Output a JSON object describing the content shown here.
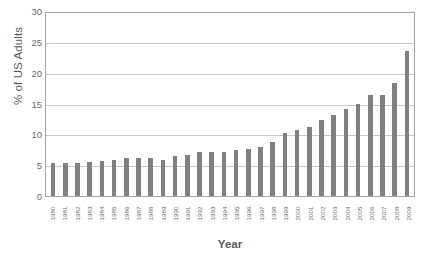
{
  "chart_data": {
    "type": "bar",
    "title": "",
    "xlabel": "Year",
    "ylabel": "% of US Adults",
    "ylim": [
      0,
      30
    ],
    "yticks": [
      0,
      5,
      10,
      15,
      20,
      25,
      30
    ],
    "grid": true,
    "legend": null,
    "bar_color": "#808080",
    "categories": [
      "1980",
      "1981",
      "1982",
      "1983",
      "1984",
      "1985",
      "1986",
      "1987",
      "1988",
      "1989",
      "1990",
      "1991",
      "1992",
      "1993",
      "1994",
      "1995",
      "1996",
      "1997",
      "1998",
      "1999",
      "2000",
      "2001",
      "2002",
      "2003",
      "2004",
      "2005",
      "2006",
      "2007",
      "2008",
      "2009"
    ],
    "values": [
      5.4,
      5.4,
      5.4,
      5.5,
      5.7,
      5.9,
      6.2,
      6.2,
      6.2,
      5.8,
      6.5,
      6.7,
      7.1,
      7.2,
      7.2,
      7.4,
      7.6,
      8.0,
      8.8,
      10.2,
      10.7,
      11.2,
      12.4,
      13.2,
      14.1,
      15.0,
      16.3,
      16.4,
      18.3,
      23.5
    ],
    "value_labels_shown": false,
    "axis_line_color": "#a6a6a6",
    "gridline_color": "#c9c9c9"
  },
  "bottom_caption": ""
}
